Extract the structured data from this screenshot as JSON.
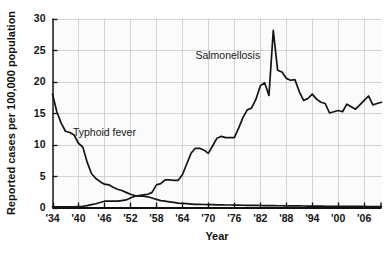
{
  "chart_data": {
    "type": "line",
    "title": "",
    "xlabel": "Year",
    "ylabel": "Reported cases per 100,000 population",
    "xlim": [
      1934,
      2010
    ],
    "ylim": [
      0,
      30
    ],
    "grid": true,
    "legend_position": "inline-annotation",
    "x_tick_labels": [
      "'34",
      "'40",
      "'46",
      "'52",
      "'58",
      "'64",
      "'70",
      "'76",
      "'82",
      "'88",
      "'94",
      "'00",
      "'06"
    ],
    "x_tick_values": [
      1934,
      1940,
      1946,
      1952,
      1958,
      1964,
      1970,
      1976,
      1982,
      1988,
      1994,
      2000,
      2006
    ],
    "y_tick_labels": [
      "0",
      "5",
      "10",
      "15",
      "20",
      "25",
      "30"
    ],
    "y_tick_values": [
      0,
      5,
      10,
      15,
      20,
      25,
      30
    ],
    "annotations": [
      {
        "text": "Typhoid fever",
        "x": 1946.0,
        "y": 11.4
      },
      {
        "text": "Salmonellosis",
        "x": 1974.5,
        "y": 23.6
      }
    ],
    "x": [
      1934,
      1935,
      1936,
      1937,
      1938,
      1939,
      1940,
      1941,
      1942,
      1943,
      1944,
      1945,
      1946,
      1947,
      1948,
      1949,
      1950,
      1951,
      1952,
      1953,
      1954,
      1955,
      1956,
      1957,
      1958,
      1959,
      1960,
      1961,
      1962,
      1963,
      1964,
      1965,
      1966,
      1967,
      1968,
      1969,
      1970,
      1971,
      1972,
      1973,
      1974,
      1975,
      1976,
      1977,
      1978,
      1979,
      1980,
      1981,
      1982,
      1983,
      1984,
      1985,
      1986,
      1987,
      1988,
      1989,
      1990,
      1991,
      1992,
      1993,
      1994,
      1995,
      1996,
      1997,
      1998,
      1999,
      2000,
      2001,
      2002,
      2003,
      2004,
      2005,
      2006,
      2007,
      2008,
      2009,
      2010
    ],
    "series": [
      {
        "name": "Typhoid fever",
        "color": "#141414",
        "values": [
          18.0,
          15.2,
          13.4,
          12.1,
          11.9,
          11.5,
          10.2,
          9.6,
          7.2,
          5.4,
          4.6,
          4.1,
          3.7,
          3.6,
          3.2,
          2.9,
          2.7,
          2.4,
          2.1,
          1.9,
          1.8,
          1.8,
          1.7,
          1.5,
          1.3,
          1.1,
          1.0,
          0.9,
          0.8,
          0.7,
          0.65,
          0.6,
          0.55,
          0.5,
          0.5,
          0.48,
          0.45,
          0.45,
          0.42,
          0.42,
          0.4,
          0.4,
          0.38,
          0.38,
          0.36,
          0.35,
          0.35,
          0.33,
          0.32,
          0.3,
          0.3,
          0.3,
          0.28,
          0.28,
          0.27,
          0.26,
          0.25,
          0.25,
          0.24,
          0.23,
          0.22,
          0.22,
          0.21,
          0.2,
          0.2,
          0.2,
          0.2,
          0.19,
          0.18,
          0.18,
          0.18,
          0.17,
          0.17,
          0.16,
          0.16,
          0.15,
          0.15
        ]
      },
      {
        "name": "Salmonellosis",
        "color": "#141414",
        "values": [
          0.1,
          0.1,
          0.1,
          0.1,
          0.1,
          0.1,
          0.15,
          0.2,
          0.3,
          0.45,
          0.6,
          0.8,
          1.0,
          1.0,
          1.0,
          1.0,
          1.1,
          1.2,
          1.5,
          1.8,
          1.9,
          2.0,
          2.1,
          2.4,
          3.6,
          3.8,
          4.4,
          4.4,
          4.3,
          4.3,
          5.2,
          6.9,
          8.6,
          9.4,
          9.4,
          9.1,
          8.6,
          9.8,
          11.0,
          11.3,
          11.1,
          11.1,
          11.1,
          12.6,
          14.3,
          15.5,
          15.8,
          17.2,
          19.3,
          19.8,
          17.8,
          28.1,
          21.8,
          21.5,
          20.5,
          20.2,
          20.3,
          18.4,
          17.0,
          17.3,
          18.0,
          17.2,
          16.7,
          16.5,
          15.0,
          15.2,
          15.4,
          15.2,
          16.4,
          16.0,
          15.6,
          16.3,
          17.0,
          17.7,
          16.3,
          16.5,
          16.7
        ]
      }
    ]
  },
  "axis": {
    "x_title": "Year",
    "y_title": "Reported cases per 100,000 population"
  }
}
